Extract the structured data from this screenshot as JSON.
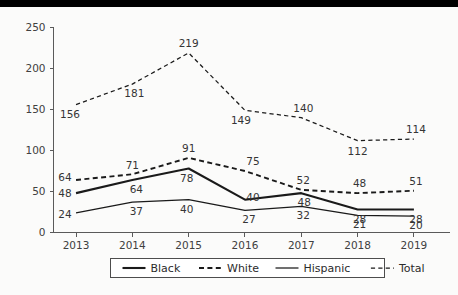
{
  "decor": {
    "top_band_color": "#000000",
    "background_color": "#fbfbfa"
  },
  "chart_data": {
    "type": "line",
    "title": "",
    "subtitle": "",
    "xlabel": "",
    "ylabel": "",
    "categories": [
      "2013",
      "2014",
      "2015",
      "2016",
      "2017",
      "2018",
      "2019"
    ],
    "x": [
      2013,
      2014,
      2015,
      2016,
      2017,
      2018,
      2019
    ],
    "ylim": [
      0,
      250
    ],
    "yticks": [
      0,
      50,
      100,
      150,
      200,
      250
    ],
    "ytick_labels": [
      "0",
      "50",
      "100",
      "150",
      "200",
      "250"
    ],
    "grid": false,
    "legend_position": "bottom",
    "show_point_labels": true,
    "series": [
      {
        "name": "Black",
        "style": "solid",
        "weight": "thick",
        "color": "#1a1a1a",
        "values": [
          48,
          64,
          78,
          40,
          48,
          28,
          28
        ],
        "labels": [
          "48",
          "64",
          "78",
          "40",
          "48",
          "28",
          "28"
        ]
      },
      {
        "name": "White",
        "style": "dashed",
        "weight": "thick",
        "color": "#1a1a1a",
        "values": [
          64,
          71,
          91,
          75,
          52,
          48,
          51
        ],
        "labels": [
          "64",
          "71",
          "91",
          "75",
          "52",
          "48",
          "51"
        ]
      },
      {
        "name": "Hispanic",
        "style": "solid",
        "weight": "thin",
        "color": "#1a1a1a",
        "values": [
          24,
          37,
          40,
          27,
          32,
          21,
          20
        ],
        "labels": [
          "24",
          "37",
          "40",
          "27",
          "32",
          "21",
          "20"
        ]
      },
      {
        "name": "Total",
        "style": "dashed",
        "weight": "thin",
        "color": "#1a1a1a",
        "values": [
          156,
          181,
          219,
          149,
          140,
          112,
          114
        ],
        "labels": [
          "156",
          "181",
          "219",
          "149",
          "140",
          "112",
          "114"
        ]
      }
    ],
    "label_offsets": {
      "Black": [
        [
          -11,
          4
        ],
        [
          4,
          13
        ],
        [
          -2,
          13
        ],
        [
          8,
          1
        ],
        [
          3,
          13
        ],
        [
          2,
          13
        ],
        [
          2,
          13
        ]
      ],
      "White": [
        [
          -11,
          1
        ],
        [
          0,
          -5
        ],
        [
          0,
          -6
        ],
        [
          8,
          -6
        ],
        [
          2,
          -6
        ],
        [
          2,
          -6
        ],
        [
          2,
          -6
        ]
      ],
      "Hispanic": [
        [
          -11,
          5
        ],
        [
          4,
          13
        ],
        [
          -2,
          13
        ],
        [
          4,
          13
        ],
        [
          2,
          13
        ],
        [
          2,
          13
        ],
        [
          2,
          13
        ]
      ],
      "Total": [
        [
          -6,
          13
        ],
        [
          2,
          13
        ],
        [
          0,
          -6
        ],
        [
          -4,
          14
        ],
        [
          2,
          -6
        ],
        [
          0,
          14
        ],
        [
          2,
          -6
        ]
      ]
    },
    "legend": {
      "entries": [
        "Black",
        "White",
        "Hispanic",
        "Total"
      ]
    }
  }
}
